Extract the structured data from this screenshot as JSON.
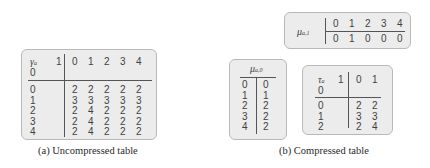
{
  "figure": {
    "uncompressed": {
      "symbol": "γ",
      "subscript": "a",
      "corner_top": "1",
      "corner_bottom": "0",
      "column_headers": [
        "0",
        "1",
        "2",
        "3",
        "4"
      ],
      "row_headers": [
        "0",
        "1",
        "2",
        "3",
        "4"
      ],
      "rows": [
        [
          "2",
          "2",
          "2",
          "2",
          "2"
        ],
        [
          "3",
          "3",
          "3",
          "3",
          "3"
        ],
        [
          "2",
          "4",
          "2",
          "2",
          "2"
        ],
        [
          "2",
          "4",
          "2",
          "2",
          "2"
        ],
        [
          "2",
          "4",
          "2",
          "2",
          "2"
        ]
      ],
      "caption": "(a) Uncompressed table"
    },
    "mu1": {
      "symbol": "μ",
      "subscript": "a,1",
      "column_headers": [
        "0",
        "1",
        "2",
        "3",
        "4"
      ],
      "values": [
        "0",
        "1",
        "0",
        "0",
        "0"
      ]
    },
    "mu0": {
      "symbol": "μ",
      "subscript": "a,0",
      "row_headers": [
        "0",
        "1",
        "2",
        "3",
        "4"
      ],
      "values": [
        "0",
        "1",
        "2",
        "2",
        "2"
      ]
    },
    "tau": {
      "symbol": "τ",
      "subscript": "a",
      "corner_top": "1",
      "corner_bottom": "0",
      "column_headers": [
        "0",
        "1"
      ],
      "row_headers": [
        "0",
        "1",
        "2"
      ],
      "rows": [
        [
          "2",
          "2"
        ],
        [
          "3",
          "3"
        ],
        [
          "2",
          "4"
        ]
      ]
    },
    "compressed_caption": "(b) Compressed table"
  }
}
